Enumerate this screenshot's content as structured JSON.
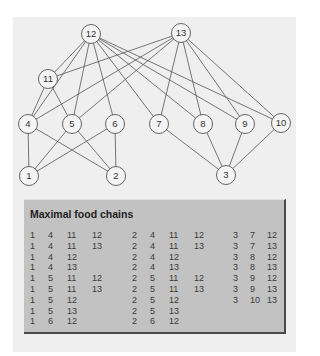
{
  "diagram": {
    "nodes": [
      {
        "id": "12",
        "x": 91,
        "y": 34
      },
      {
        "id": "13",
        "x": 181,
        "y": 33
      },
      {
        "id": "11",
        "x": 48,
        "y": 79
      },
      {
        "id": "4",
        "x": 28,
        "y": 124
      },
      {
        "id": "5",
        "x": 72,
        "y": 124
      },
      {
        "id": "6",
        "x": 115,
        "y": 124
      },
      {
        "id": "7",
        "x": 159,
        "y": 124
      },
      {
        "id": "8",
        "x": 203,
        "y": 124
      },
      {
        "id": "9",
        "x": 245,
        "y": 124
      },
      {
        "id": "10",
        "x": 281,
        "y": 123
      },
      {
        "id": "1",
        "x": 29,
        "y": 176
      },
      {
        "id": "2",
        "x": 116,
        "y": 176
      },
      {
        "id": "3",
        "x": 226,
        "y": 175
      }
    ],
    "edges": [
      [
        "12",
        "11"
      ],
      [
        "12",
        "4"
      ],
      [
        "12",
        "5"
      ],
      [
        "12",
        "6"
      ],
      [
        "12",
        "7"
      ],
      [
        "12",
        "8"
      ],
      [
        "12",
        "9"
      ],
      [
        "12",
        "10"
      ],
      [
        "13",
        "11"
      ],
      [
        "13",
        "4"
      ],
      [
        "13",
        "5"
      ],
      [
        "13",
        "7"
      ],
      [
        "13",
        "8"
      ],
      [
        "13",
        "9"
      ],
      [
        "13",
        "10"
      ],
      [
        "11",
        "4"
      ],
      [
        "11",
        "5"
      ],
      [
        "4",
        "1"
      ],
      [
        "4",
        "2"
      ],
      [
        "5",
        "1"
      ],
      [
        "5",
        "2"
      ],
      [
        "6",
        "1"
      ],
      [
        "6",
        "2"
      ],
      [
        "7",
        "3"
      ],
      [
        "8",
        "3"
      ],
      [
        "9",
        "3"
      ],
      [
        "10",
        "3"
      ]
    ],
    "colors": {
      "node_fill": "#f4f4f4",
      "stroke": "#555555",
      "background": "#efefef"
    }
  },
  "panel": {
    "title": "Maximal food chains",
    "columns": [
      [
        [
          "1",
          "4",
          "11",
          "12"
        ],
        [
          "1",
          "4",
          "11",
          "13"
        ],
        [
          "1",
          "4",
          "12"
        ],
        [
          "1",
          "4",
          "13"
        ],
        [
          "1",
          "5",
          "11",
          "12"
        ],
        [
          "1",
          "5",
          "11",
          "13"
        ],
        [
          "1",
          "5",
          "12"
        ],
        [
          "1",
          "5",
          "13"
        ],
        [
          "1",
          "6",
          "12"
        ]
      ],
      [
        [
          "2",
          "4",
          "11",
          "12"
        ],
        [
          "2",
          "4",
          "11",
          "13"
        ],
        [
          "2",
          "4",
          "12"
        ],
        [
          "2",
          "4",
          "13"
        ],
        [
          "2",
          "5",
          "11",
          "12"
        ],
        [
          "2",
          "5",
          "11",
          "13"
        ],
        [
          "2",
          "5",
          "12"
        ],
        [
          "2",
          "5",
          "13"
        ],
        [
          "2",
          "6",
          "12"
        ]
      ],
      [
        [
          "3",
          "7",
          "12"
        ],
        [
          "3",
          "7",
          "13"
        ],
        [
          "3",
          "8",
          "12"
        ],
        [
          "3",
          "8",
          "13"
        ],
        [
          "3",
          "9",
          "12"
        ],
        [
          "3",
          "9",
          "13"
        ],
        [
          "3",
          "10",
          "13"
        ]
      ]
    ],
    "colors": {
      "fill": "#c2c2c2",
      "border": "#4a4a4a"
    }
  }
}
